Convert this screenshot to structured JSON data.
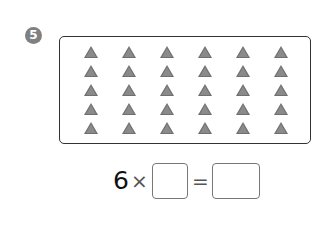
{
  "problem": {
    "number": "5",
    "badge_color": "#808080"
  },
  "figure": {
    "shape": "triangle",
    "rows": 5,
    "columns": 6,
    "total": 30,
    "triangle_color": "#7a7a7a"
  },
  "equation": {
    "multiplicand": "6",
    "times_sign": "×",
    "equals_sign": "=",
    "blank_1": "",
    "blank_2": ""
  }
}
